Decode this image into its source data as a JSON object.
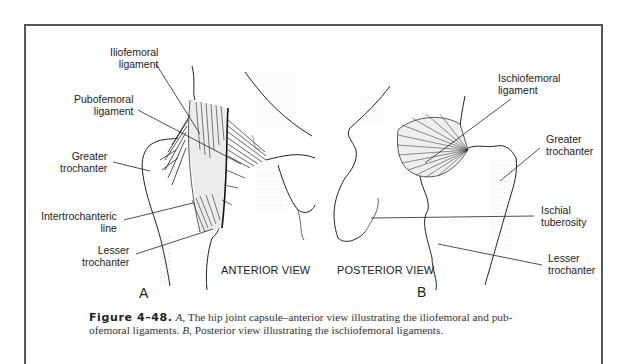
{
  "figure": {
    "number_label": "Figure 4–48.",
    "caption_part1_letter": "A",
    "caption_part1_text": ", The hip joint capsule–anterior view illustrating the iliofemoral and pub-",
    "caption_line2_pre": "ofemoral ligaments. ",
    "caption_part2_letter": "B",
    "caption_part2_text": ", Posterior view illustrating the ischiofemoral ligaments."
  },
  "panel_a": {
    "letter": "A",
    "view_title": "ANTERIOR VIEW",
    "labels": {
      "iliofemoral": "Iliofemoral\nligament",
      "pubofemoral": "Pubofemoral\nligament",
      "greater_trochanter": "Greater\ntrochanter",
      "intertrochanteric": "Intertrochanteric\nline",
      "lesser_trochanter": "Lesser\ntrochanter"
    }
  },
  "panel_b": {
    "letter": "B",
    "view_title": "POSTERIOR VIEW",
    "labels": {
      "ischiofemoral": "Ischiofemoral\nligament",
      "greater_trochanter": "Greater\ntrochanter",
      "ischial_tuberosity": "Ischial\ntuberosity",
      "lesser_trochanter": "Lesser\ntrochanter"
    }
  },
  "colors": {
    "frame": "#555555",
    "ink": "#222222",
    "ligament_fill": "#e6e6e6"
  }
}
